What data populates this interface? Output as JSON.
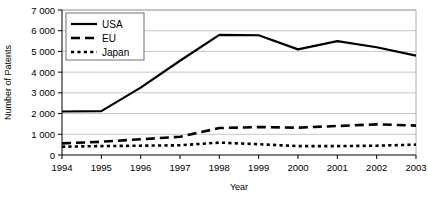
{
  "chart_data": {
    "type": "line",
    "title": "",
    "xlabel": "Year",
    "ylabel": "Number of Patents",
    "x": [
      1994,
      1995,
      1996,
      1997,
      1998,
      1999,
      2000,
      2001,
      2002,
      2003
    ],
    "categories": [
      "1994",
      "1995",
      "1996",
      "1997",
      "1998",
      "1999",
      "2000",
      "2001",
      "2002",
      "2003"
    ],
    "xlim": [
      1994,
      2003
    ],
    "ylim": [
      0,
      7000
    ],
    "yticks": [
      0,
      1000,
      2000,
      3000,
      4000,
      5000,
      6000,
      7000
    ],
    "ytick_labels": [
      "0",
      "1 000",
      "2 000",
      "3 000",
      "4 000",
      "5 000",
      "6 000",
      "7 000"
    ],
    "grid": "horizontal",
    "legend_position": "top-left",
    "series": [
      {
        "name": "USA",
        "style": "solid",
        "color": "#000000",
        "values": [
          2100,
          2120,
          3250,
          4550,
          5800,
          5780,
          5100,
          5500,
          5200,
          4800
        ]
      },
      {
        "name": "EU",
        "style": "dashed",
        "color": "#000000",
        "values": [
          560,
          640,
          760,
          880,
          1300,
          1350,
          1320,
          1400,
          1480,
          1420
        ]
      },
      {
        "name": "Japan",
        "style": "dotted",
        "color": "#000000",
        "values": [
          400,
          430,
          450,
          470,
          600,
          520,
          430,
          430,
          450,
          500
        ]
      }
    ]
  },
  "legend": {
    "items": [
      {
        "label": "USA",
        "style": "solid"
      },
      {
        "label": "EU",
        "style": "dashed"
      },
      {
        "label": "Japan",
        "style": "dotted"
      }
    ]
  },
  "axes": {
    "x_title": "Year",
    "y_title": "Number of Patents"
  }
}
